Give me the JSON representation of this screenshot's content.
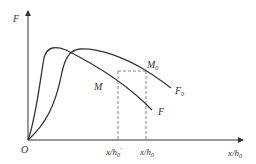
{
  "diagram": {
    "y_axis_label": "F",
    "x_axis_label": "x/h",
    "x_axis_label_sub": "0",
    "origin_label": "O",
    "curves": [
      {
        "name": "F",
        "label": "F",
        "sub": ""
      },
      {
        "name": "F0",
        "label": "F",
        "sub": "0"
      }
    ],
    "points": [
      {
        "name": "M",
        "label": "M",
        "sub": ""
      },
      {
        "name": "M0",
        "label": "M",
        "sub": "0"
      }
    ],
    "ticks": [
      {
        "label": "x/h",
        "sub": "0",
        "prime": "'"
      },
      {
        "label": "x/h",
        "sub": "0",
        "prime": ""
      }
    ],
    "colors": {
      "line": "#333333",
      "dash": "#666666"
    }
  }
}
